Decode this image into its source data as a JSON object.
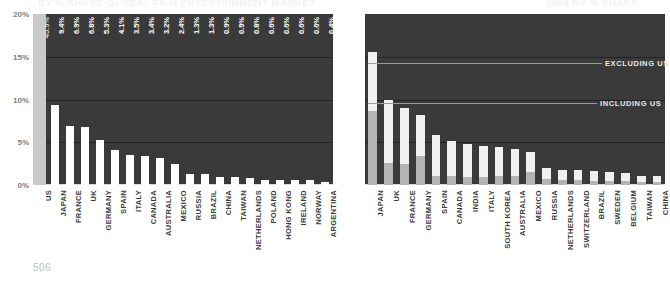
{
  "page": {
    "number": "506"
  },
  "titles": {
    "left": "BY % SHARE GLOBAL FILM ENTERTAINMENT MARKET",
    "right": "2009 BY % SHARE"
  },
  "axis": {
    "yticks": [
      "20%",
      "15%",
      "10%",
      "5%",
      "0%"
    ],
    "ymin": 0,
    "ymax": 20,
    "ylabel": "",
    "xlabel": ""
  },
  "annotations": {
    "excluding": "EXCLUDING US",
    "including": "INCLUDING US"
  },
  "chart_data": [
    {
      "type": "bar",
      "id": "left",
      "title": "BY % SHARE GLOBAL FILM ENTERTAINMENT MARKET",
      "xlabel": "",
      "ylabel": "% share",
      "ylim": [
        0,
        20
      ],
      "grid": true,
      "legend": "none",
      "categories": [
        "US",
        "JAPAN",
        "FRANCE",
        "UK",
        "GERMANY",
        "SPAIN",
        "ITALY",
        "CANADA",
        "AUSTRALIA",
        "MEXICO",
        "RUSSIA",
        "BRAZIL",
        "CHINA",
        "TAIWAN",
        "NETHERLANDS",
        "POLAND",
        "HONG KONG",
        "IRELAND",
        "NORWAY",
        "ARGENTINA"
      ],
      "values": [
        45.9,
        9.4,
        6.9,
        6.8,
        5.3,
        4.1,
        3.5,
        3.4,
        3.2,
        2.4,
        1.3,
        1.3,
        0.9,
        0.9,
        0.8,
        0.6,
        0.6,
        0.6,
        0.6,
        0.4
      ],
      "data_labels": [
        "45.9%",
        "9.4%",
        "6.9%",
        "6.8%",
        "5.3%",
        "4.1%",
        "3.5%",
        "3.4%",
        "3.2%",
        "2.4%",
        "1.3%",
        "1.3%",
        "0.9%",
        "0.9%",
        "0.8%",
        "0.6%",
        "0.6%",
        "0.6%",
        "0.6%",
        "0.4%"
      ],
      "highlight_index": 0,
      "note": "US bar exceeds axis maximum and is drawn off-scale"
    },
    {
      "type": "bar",
      "id": "right",
      "title": "2009 BY % SHARE",
      "xlabel": "",
      "ylabel": "% share",
      "ylim": [
        0,
        20
      ],
      "grid": true,
      "legend": "none",
      "categories": [
        "JAPAN",
        "UK",
        "FRANCE",
        "GERMANY",
        "SPAIN",
        "CANADA",
        "INDIA",
        "ITALY",
        "SOUTH KOREA",
        "AUSTRALIA",
        "MEXICO",
        "RUSSIA",
        "NETHERLANDS",
        "SWITZERLAND",
        "BRAZIL",
        "SWEDEN",
        "BELGIUM",
        "TAIWAN",
        "CHINA"
      ],
      "series": [
        {
          "name": "INCLUDING US",
          "values": [
            15.5,
            9.9,
            9.0,
            8.2,
            5.8,
            5.2,
            4.8,
            4.6,
            4.4,
            4.2,
            3.9,
            2.0,
            1.8,
            1.7,
            1.6,
            1.5,
            1.4,
            1.1,
            1.0
          ]
        },
        {
          "name": "EXCLUDING US",
          "values": [
            8.6,
            2.6,
            2.4,
            3.4,
            1.1,
            1.0,
            0.9,
            0.9,
            1.0,
            1.0,
            1.5,
            0.7,
            0.6,
            0.6,
            0.5,
            0.5,
            0.5,
            0.4,
            0.4
          ]
        }
      ]
    }
  ]
}
